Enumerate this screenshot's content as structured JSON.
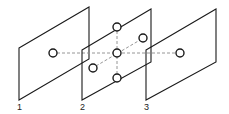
{
  "diagram": {
    "colors": {
      "stroke": "#1a1a1a",
      "dashed": "#8a8a8a",
      "background": "#ffffff"
    },
    "planes": [
      {
        "id": "1",
        "label": "1",
        "points": "19,48 89,7 89,59 19,100",
        "label_x": 17,
        "label_y": 110
      },
      {
        "id": "2",
        "label": "2",
        "points": "82,50 151,9 151,62 82,100",
        "label_x": 80,
        "label_y": 110
      },
      {
        "id": "3",
        "label": "3",
        "points": "146,50 216,9 216,62 146,100",
        "label_x": 144,
        "label_y": 110
      }
    ],
    "nodes": [
      {
        "id": "left",
        "cx": 53,
        "cy": 53
      },
      {
        "id": "top",
        "cx": 117,
        "cy": 27
      },
      {
        "id": "upper-right",
        "cx": 143,
        "cy": 38
      },
      {
        "id": "center",
        "cx": 117,
        "cy": 53
      },
      {
        "id": "lower-left",
        "cx": 93,
        "cy": 68
      },
      {
        "id": "bottom",
        "cx": 117,
        "cy": 78
      },
      {
        "id": "right",
        "cx": 180,
        "cy": 53
      }
    ],
    "dashed_lines": [
      {
        "id": "horizontal",
        "x1": 57,
        "y1": 53,
        "x2": 176,
        "y2": 53
      },
      {
        "id": "vertical",
        "x1": 117,
        "y1": 31,
        "x2": 117,
        "y2": 74
      },
      {
        "id": "diagonal",
        "x1": 96,
        "y1": 66,
        "x2": 140,
        "y2": 40
      }
    ]
  }
}
